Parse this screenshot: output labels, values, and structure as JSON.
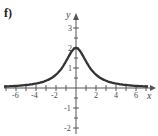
{
  "panel_label": "f)",
  "chart_data": {
    "type": "line",
    "title": "",
    "xlabel": "x",
    "ylabel": "y",
    "xlim": [
      -7,
      7
    ],
    "ylim": [
      -2,
      3
    ],
    "x_ticks": [
      -6,
      -4,
      -2,
      2,
      4,
      6
    ],
    "y_ticks": [
      -2,
      -1,
      1,
      2,
      3
    ],
    "grid": false,
    "series": [
      {
        "name": "f(x)",
        "x": [
          -7,
          -6,
          -5,
          -4,
          -3,
          -2,
          -1,
          0,
          1,
          2,
          3,
          4,
          5,
          6,
          7
        ],
        "values": [
          0.08,
          0.11,
          0.15,
          0.22,
          0.36,
          0.67,
          1.33,
          2.0,
          1.33,
          0.67,
          0.36,
          0.22,
          0.15,
          0.11,
          0.08
        ]
      }
    ]
  },
  "labels": {
    "x_axis": "x",
    "y_axis": "y",
    "xt": [
      "-6",
      "-4",
      "-2",
      "2",
      "4",
      "6"
    ],
    "yt": [
      "3",
      "2",
      "1",
      "-1",
      "-2"
    ]
  }
}
